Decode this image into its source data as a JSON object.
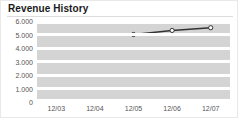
{
  "widget": {
    "title": "Revenue History",
    "accent_color": "#1a1a1a",
    "plot_band_color": "#d4d4d4",
    "plot_line_color": "#ffffff",
    "border_color": "#e8e8e8",
    "axis_text_color": "#555555"
  },
  "chart_data": {
    "type": "line",
    "title": "Revenue History",
    "xlabel": "",
    "ylabel": "",
    "categories": [
      "12/03",
      "12/04",
      "12/05",
      "12/06",
      "12/07"
    ],
    "x": [
      "12/03",
      "12/04",
      "12/05",
      "12/06",
      "12/07"
    ],
    "values": [
      null,
      null,
      5000,
      5300,
      5500
    ],
    "series": [
      {
        "name": "Revenue",
        "values": [
          null,
          null,
          5000,
          5300,
          5500
        ],
        "line_color": "#333333",
        "marker": "circle",
        "marker_fill": "#ffffff",
        "marker_edge": "#333333"
      }
    ],
    "ylim": [
      0,
      6000
    ],
    "ytick_values": [
      6000,
      5000,
      4000,
      3000,
      2000,
      1000,
      0
    ],
    "ytick_labels": [
      "6.000",
      "5.000",
      "4.000",
      "3.000",
      "2.000",
      "1.000",
      "0"
    ],
    "xtick_labels": [
      "12/03",
      "12/04",
      "12/05",
      "12/06",
      "12/07"
    ],
    "grid": true,
    "grid_style": "horizontal-bands",
    "legend": false,
    "legend_position": "none"
  }
}
